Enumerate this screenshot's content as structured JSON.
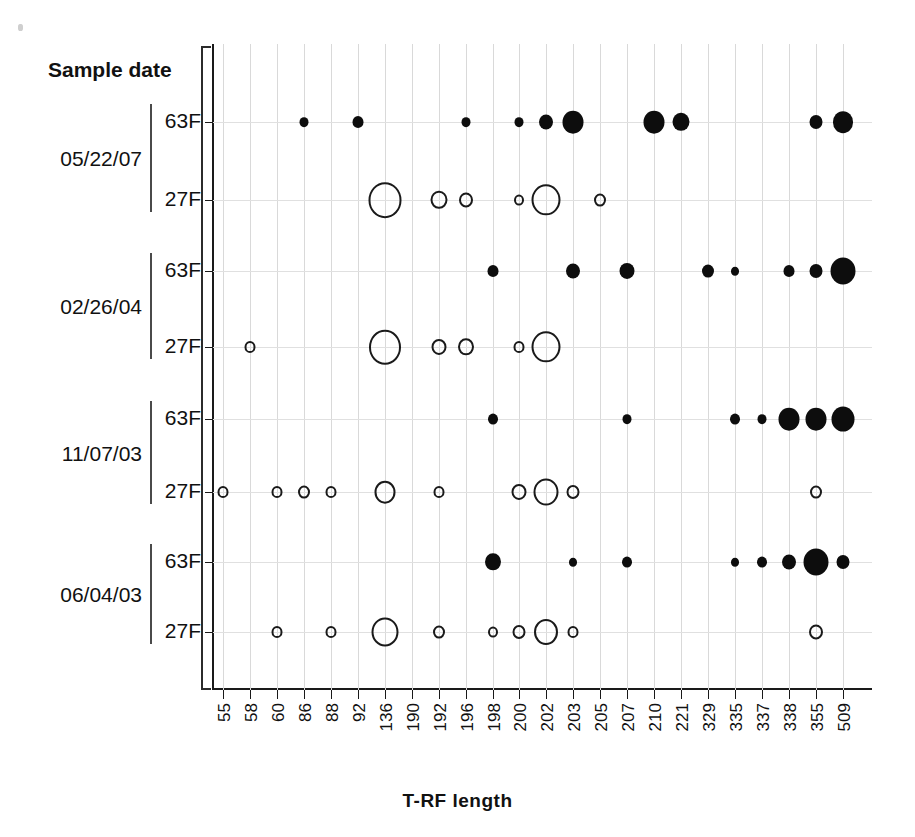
{
  "axes": {
    "y_title": "Sample date",
    "x_title": "T-RF length",
    "primer_labels": [
      "63F",
      "27F"
    ],
    "dates": [
      "05/22/07",
      "02/26/04",
      "11/07/03",
      "06/04/03"
    ]
  },
  "chart_data": {
    "type": "scatter",
    "title": "",
    "xlabel": "T-RF length",
    "ylabel": "Sample date",
    "grid": true,
    "legend": "none",
    "marker_encoding": {
      "filled_circle": "63F primer",
      "open_circle": "27F primer",
      "size": "relative abundance of T-RF"
    },
    "categories": [
      "55",
      "58",
      "60",
      "86",
      "88",
      "92",
      "136",
      "190",
      "192",
      "196",
      "198",
      "200",
      "202",
      "203",
      "205",
      "207",
      "210",
      "221",
      "329",
      "335",
      "337",
      "338",
      "355",
      "509"
    ],
    "rows": [
      {
        "date": "05/22/07",
        "primer": "63F",
        "style": "filled"
      },
      {
        "date": "05/22/07",
        "primer": "27F",
        "style": "open"
      },
      {
        "date": "02/26/04",
        "primer": "63F",
        "style": "filled"
      },
      {
        "date": "02/26/04",
        "primer": "27F",
        "style": "open"
      },
      {
        "date": "11/07/03",
        "primer": "63F",
        "style": "filled"
      },
      {
        "date": "11/07/03",
        "primer": "27F",
        "style": "open"
      },
      {
        "date": "06/04/03",
        "primer": "63F",
        "style": "filled"
      },
      {
        "date": "06/04/03",
        "primer": "27F",
        "style": "open"
      }
    ],
    "series": [
      {
        "name": "05/22/07 63F",
        "row": 0,
        "points": [
          {
            "x": "86",
            "size": 9
          },
          {
            "x": "92",
            "size": 11
          },
          {
            "x": "196",
            "size": 9
          },
          {
            "x": "200",
            "size": 9
          },
          {
            "x": "202",
            "size": 14
          },
          {
            "x": "203",
            "size": 21
          },
          {
            "x": "210",
            "size": 21
          },
          {
            "x": "221",
            "size": 17
          },
          {
            "x": "355",
            "size": 13
          },
          {
            "x": "509",
            "size": 20
          }
        ]
      },
      {
        "name": "05/22/07 27F",
        "row": 1,
        "points": [
          {
            "x": "136",
            "size": 33
          },
          {
            "x": "192",
            "size": 17
          },
          {
            "x": "196",
            "size": 14
          },
          {
            "x": "200",
            "size": 10
          },
          {
            "x": "202",
            "size": 29
          },
          {
            "x": "205",
            "size": 12
          }
        ]
      },
      {
        "name": "02/26/04 63F",
        "row": 2,
        "points": [
          {
            "x": "198",
            "size": 11
          },
          {
            "x": "203",
            "size": 14
          },
          {
            "x": "207",
            "size": 15
          },
          {
            "x": "329",
            "size": 12
          },
          {
            "x": "335",
            "size": 8
          },
          {
            "x": "338",
            "size": 11
          },
          {
            "x": "355",
            "size": 13
          },
          {
            "x": "509",
            "size": 25
          }
        ]
      },
      {
        "name": "02/26/04 27F",
        "row": 3,
        "points": [
          {
            "x": "58",
            "size": 11
          },
          {
            "x": "136",
            "size": 32
          },
          {
            "x": "192",
            "size": 15
          },
          {
            "x": "196",
            "size": 16
          },
          {
            "x": "200",
            "size": 11
          },
          {
            "x": "202",
            "size": 29
          }
        ]
      },
      {
        "name": "11/07/03 63F",
        "row": 4,
        "points": [
          {
            "x": "198",
            "size": 10
          },
          {
            "x": "207",
            "size": 9
          },
          {
            "x": "335",
            "size": 10
          },
          {
            "x": "337",
            "size": 9
          },
          {
            "x": "338",
            "size": 21
          },
          {
            "x": "355",
            "size": 21
          },
          {
            "x": "509",
            "size": 23
          }
        ]
      },
      {
        "name": "11/07/03 27F",
        "row": 5,
        "points": [
          {
            "x": "55",
            "size": 11
          },
          {
            "x": "60",
            "size": 11
          },
          {
            "x": "86",
            "size": 12
          },
          {
            "x": "88",
            "size": 11
          },
          {
            "x": "136",
            "size": 21
          },
          {
            "x": "192",
            "size": 11
          },
          {
            "x": "200",
            "size": 15
          },
          {
            "x": "202",
            "size": 25
          },
          {
            "x": "203",
            "size": 13
          },
          {
            "x": "355",
            "size": 12
          }
        ]
      },
      {
        "name": "06/04/03 63F",
        "row": 6,
        "points": [
          {
            "x": "198",
            "size": 16
          },
          {
            "x": "203",
            "size": 8
          },
          {
            "x": "207",
            "size": 10
          },
          {
            "x": "335",
            "size": 8
          },
          {
            "x": "337",
            "size": 10
          },
          {
            "x": "338",
            "size": 14
          },
          {
            "x": "355",
            "size": 25
          },
          {
            "x": "509",
            "size": 13
          }
        ]
      },
      {
        "name": "06/04/03 27F",
        "row": 7,
        "points": [
          {
            "x": "60",
            "size": 11
          },
          {
            "x": "88",
            "size": 11
          },
          {
            "x": "136",
            "size": 27
          },
          {
            "x": "192",
            "size": 12
          },
          {
            "x": "198",
            "size": 10
          },
          {
            "x": "200",
            "size": 13
          },
          {
            "x": "202",
            "size": 24
          },
          {
            "x": "203",
            "size": 11
          },
          {
            "x": "355",
            "size": 14
          }
        ]
      }
    ]
  },
  "colors": {
    "filled_marker": "#0d0d0d",
    "open_marker_stroke": "#1a1a1a",
    "grid": "#d9d9d9",
    "axis": "#1a1a1a"
  }
}
